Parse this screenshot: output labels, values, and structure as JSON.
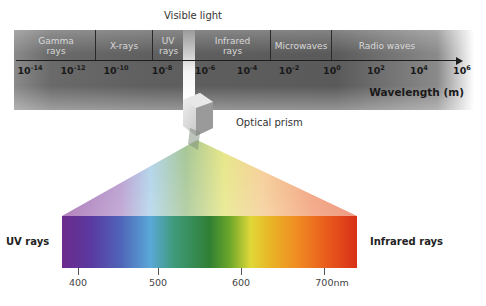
{
  "band": {
    "regions": [
      {
        "label": "Gamma rays"
      },
      {
        "label": "X-rays"
      },
      {
        "label": "UV rays"
      },
      {
        "label": "Infrared rays"
      },
      {
        "label": "Microwaves"
      },
      {
        "label": "Radio waves"
      }
    ],
    "ticks": [
      {
        "base": "10",
        "exp": "-14"
      },
      {
        "base": "10",
        "exp": "-12"
      },
      {
        "base": "10",
        "exp": "-10"
      },
      {
        "base": "10",
        "exp": "-8"
      },
      {
        "base": "10",
        "exp": "-6"
      },
      {
        "base": "10",
        "exp": "-4"
      },
      {
        "base": "10",
        "exp": "-2"
      },
      {
        "base": "10",
        "exp": "0"
      },
      {
        "base": "10",
        "exp": "2"
      },
      {
        "base": "10",
        "exp": "4"
      },
      {
        "base": "10",
        "exp": "6"
      }
    ],
    "axis_title": "Wavelength (m)"
  },
  "visible_label": "Visible light",
  "prism_label": "Optical prism",
  "spectrum": {
    "left_label": "UV rays",
    "right_label": "Infrared rays",
    "ticks": [
      "400",
      "500",
      "600",
      "700nm"
    ]
  }
}
